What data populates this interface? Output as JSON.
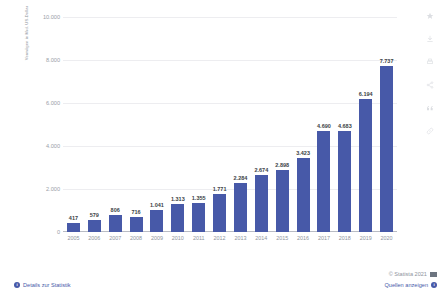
{
  "chart_data": {
    "type": "bar",
    "title": "",
    "xlabel": "",
    "ylabel": "Vermögen in Mrd. US-Dollar",
    "ylim": [
      0,
      10000
    ],
    "grid": true,
    "legend": "none",
    "bar_color": "#4759a8",
    "number_format": "de-DE (period thousands separator)",
    "categories": [
      "2005",
      "2006",
      "2007",
      "2008",
      "2009",
      "2010",
      "2011",
      "2012",
      "2013",
      "2014",
      "2015",
      "2016",
      "2017",
      "2018",
      "2019",
      "2020"
    ],
    "values": [
      417,
      579,
      806,
      716,
      1041,
      1313,
      1355,
      1771,
      2284,
      2674,
      2898,
      3423,
      4690,
      4683,
      6194,
      7737
    ],
    "value_labels": [
      "417",
      "579",
      "806",
      "716",
      "1.041",
      "1.313",
      "1.355",
      "1.771",
      "2.284",
      "2.674",
      "2.898",
      "3.423",
      "4.690",
      "4.683",
      "6.194",
      "7.737"
    ],
    "y_ticks": [
      0,
      2000,
      4000,
      6000,
      8000,
      10000
    ],
    "y_tick_labels": [
      "0",
      "2.000",
      "4.000",
      "6.000",
      "8.000",
      "10.000"
    ]
  },
  "icon_rail": {
    "items": [
      {
        "name": "favorite-star-icon",
        "glyph": "star"
      },
      {
        "name": "download-icon",
        "glyph": "download"
      },
      {
        "name": "print-icon",
        "glyph": "print"
      },
      {
        "name": "share-icon",
        "glyph": "share"
      },
      {
        "name": "quote-icon",
        "glyph": "quote"
      },
      {
        "name": "link-icon",
        "glyph": "link"
      }
    ]
  },
  "footer": {
    "details_label": "Details zur Statistik",
    "details_badge": "i",
    "copyright": "© Statista 2021",
    "sources_label": "Quellen anzeigen",
    "sources_badge": "i"
  }
}
